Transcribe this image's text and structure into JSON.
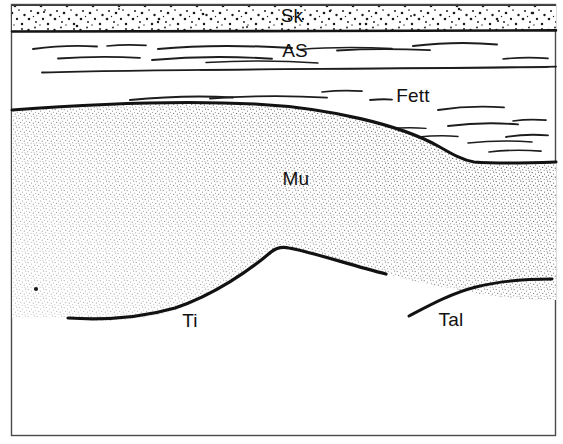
{
  "figure": {
    "type": "anatomical-cross-section",
    "title": "",
    "width": 563,
    "height": 444,
    "background_color": "#ffffff",
    "line_color": "#111111",
    "frame": {
      "visible": true,
      "color": "#444444",
      "x": 11,
      "y": 4,
      "width": 545,
      "height": 432,
      "stroke_width": 1.4
    },
    "labels": [
      {
        "id": "sk",
        "text": "Sk",
        "x": 292,
        "y": 17,
        "layer": "skin"
      },
      {
        "id": "as",
        "text": "AS",
        "x": 295,
        "y": 52,
        "layer": "subcutaneous"
      },
      {
        "id": "fett",
        "text": "Fett",
        "x": 413,
        "y": 97,
        "layer": "fat"
      },
      {
        "id": "mu",
        "text": "Mu",
        "x": 296,
        "y": 180,
        "layer": "muscle"
      },
      {
        "id": "ti",
        "text": "Ti",
        "x": 190,
        "y": 322,
        "layer": "tibia"
      },
      {
        "id": "tal",
        "text": "Tal",
        "x": 451,
        "y": 321,
        "layer": "talus"
      }
    ],
    "regions": [
      {
        "id": "skin-band",
        "name": "Sk",
        "fill_pattern": "coarse-stipple",
        "top_y": 5,
        "bottom_y": 31
      },
      {
        "id": "subcutaneous-band",
        "name": "AS",
        "fill_pattern": "none",
        "top_y": 33,
        "bottom_y": 78
      },
      {
        "id": "fat-band",
        "name": "Fett",
        "fill_pattern": "none",
        "top_y": 78,
        "bottom_y": 165
      },
      {
        "id": "muscle-body",
        "name": "Mu",
        "fill_pattern": "fine-stipple",
        "top_y": 110,
        "bottom_y": 320
      }
    ],
    "boundaries": [
      {
        "id": "skin-top-line",
        "style": "thin-solid"
      },
      {
        "id": "skin-bottom-line",
        "style": "thick-solid"
      },
      {
        "id": "subcutaneous-line",
        "style": "thin-solid"
      },
      {
        "id": "muscle-top-line",
        "style": "thick-solid"
      },
      {
        "id": "tibia-outline",
        "style": "thick-solid"
      },
      {
        "id": "talus-outline",
        "style": "thick-solid"
      }
    ],
    "fascicle_dashes": {
      "as_layer_count": 10,
      "fett_layer_count": 12,
      "style": "short-wavy-strokes"
    }
  }
}
